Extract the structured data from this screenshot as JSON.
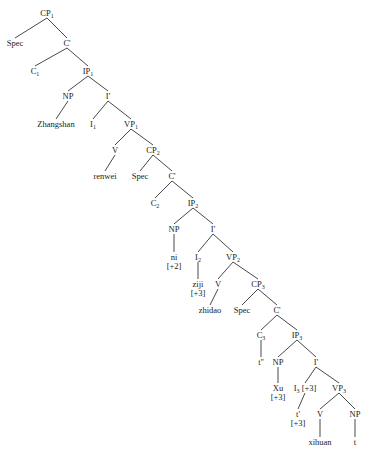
{
  "diagram": {
    "type": "syntax-tree",
    "nodes": [
      {
        "id": "cp1",
        "label": "CP",
        "sub": "1",
        "x": 47,
        "y": 14
      },
      {
        "id": "spec1",
        "label": "Spec",
        "x": 15,
        "y": 44
      },
      {
        "id": "cbar1",
        "label": "C'",
        "x": 67,
        "y": 44
      },
      {
        "id": "c1",
        "label": "C",
        "sub": "1",
        "x": 35,
        "y": 72
      },
      {
        "id": "ip1",
        "label": "IP",
        "sub": "1",
        "x": 88,
        "y": 72
      },
      {
        "id": "np1",
        "label": "NP",
        "x": 68,
        "y": 97
      },
      {
        "id": "ibar1",
        "label": "I'",
        "x": 108,
        "y": 97
      },
      {
        "id": "zhangshan",
        "label": "Zhangshan",
        "x": 56,
        "y": 125
      },
      {
        "id": "i1",
        "label": "I",
        "sub": "1",
        "x": 93,
        "y": 125
      },
      {
        "id": "vp1",
        "label": "VP",
        "sub": "1",
        "x": 131,
        "y": 125
      },
      {
        "id": "v1",
        "label": "V",
        "x": 115,
        "y": 151
      },
      {
        "id": "cp2",
        "label": "CP",
        "sub": "2",
        "x": 153,
        "y": 151
      },
      {
        "id": "renwei",
        "label": "renwei",
        "x": 105,
        "y": 177
      },
      {
        "id": "spec2",
        "label": "Spec",
        "x": 140,
        "y": 177
      },
      {
        "id": "cbar2",
        "label": "C'",
        "x": 172,
        "y": 177
      },
      {
        "id": "c2",
        "label": "C",
        "sub": "2",
        "x": 155,
        "y": 204
      },
      {
        "id": "ip2",
        "label": "IP",
        "sub": "2",
        "x": 193,
        "y": 204
      },
      {
        "id": "np2",
        "label": "NP",
        "x": 174,
        "y": 230
      },
      {
        "id": "ibar2",
        "label": "I'",
        "x": 213,
        "y": 230
      },
      {
        "id": "ni",
        "label": "ni",
        "extra": "[+2]",
        "x": 174,
        "y": 258
      },
      {
        "id": "i2",
        "label": "I",
        "sub": "2",
        "x": 198,
        "y": 258
      },
      {
        "id": "vp2",
        "label": "VP",
        "sub": "2",
        "x": 233,
        "y": 258
      },
      {
        "id": "ziji",
        "label": "ziji",
        "extra": "[+3]",
        "x": 198,
        "y": 285
      },
      {
        "id": "v2",
        "label": "V",
        "x": 218,
        "y": 285
      },
      {
        "id": "cp3",
        "label": "CP",
        "sub": "3",
        "x": 258,
        "y": 285
      },
      {
        "id": "zhidao",
        "label": "zhidao",
        "x": 210,
        "y": 311
      },
      {
        "id": "spec3",
        "label": "Spec",
        "x": 242,
        "y": 311
      },
      {
        "id": "cbar3",
        "label": "C'",
        "x": 277,
        "y": 311
      },
      {
        "id": "c3",
        "label": "C",
        "sub": "3",
        "x": 261,
        "y": 336
      },
      {
        "id": "ip3",
        "label": "IP",
        "sub": "3",
        "x": 297,
        "y": 336
      },
      {
        "id": "tpp",
        "label": "t''",
        "x": 261,
        "y": 363
      },
      {
        "id": "np3",
        "label": "NP",
        "x": 278,
        "y": 363
      },
      {
        "id": "ibar3",
        "label": "I'",
        "x": 316,
        "y": 363
      },
      {
        "id": "xu",
        "label": "Xu",
        "extra": "[+3]",
        "x": 278,
        "y": 389
      },
      {
        "id": "i3",
        "label": "I",
        "sub": "3",
        "after": " [+3]",
        "x": 305,
        "y": 389
      },
      {
        "id": "vp3",
        "label": "VP",
        "sub": "3",
        "x": 339,
        "y": 389
      },
      {
        "id": "tp",
        "label": "t'",
        "extra": "[+3]",
        "x": 298,
        "y": 415
      },
      {
        "id": "v3",
        "label": "V",
        "x": 320,
        "y": 415
      },
      {
        "id": "np4",
        "label": "NP",
        "x": 355,
        "y": 415
      },
      {
        "id": "xihuan",
        "label": "xihuan",
        "x": 320,
        "y": 443
      },
      {
        "id": "t",
        "label": "t",
        "x": 355,
        "y": 443
      }
    ],
    "edges": [
      [
        "cp1",
        "spec1"
      ],
      [
        "cp1",
        "cbar1"
      ],
      [
        "cbar1",
        "c1"
      ],
      [
        "cbar1",
        "ip1"
      ],
      [
        "ip1",
        "np1"
      ],
      [
        "ip1",
        "ibar1"
      ],
      [
        "np1",
        "zhangshan"
      ],
      [
        "ibar1",
        "i1"
      ],
      [
        "ibar1",
        "vp1"
      ],
      [
        "vp1",
        "v1"
      ],
      [
        "vp1",
        "cp2"
      ],
      [
        "v1",
        "renwei"
      ],
      [
        "cp2",
        "spec2"
      ],
      [
        "cp2",
        "cbar2"
      ],
      [
        "cbar2",
        "c2"
      ],
      [
        "cbar2",
        "ip2"
      ],
      [
        "ip2",
        "np2"
      ],
      [
        "ip2",
        "ibar2"
      ],
      [
        "np2",
        "ni"
      ],
      [
        "ibar2",
        "i2"
      ],
      [
        "ibar2",
        "vp2"
      ],
      [
        "i2",
        "ziji"
      ],
      [
        "vp2",
        "v2"
      ],
      [
        "vp2",
        "cp3"
      ],
      [
        "v2",
        "zhidao"
      ],
      [
        "cp3",
        "spec3"
      ],
      [
        "cp3",
        "cbar3"
      ],
      [
        "cbar3",
        "c3"
      ],
      [
        "cbar3",
        "ip3"
      ],
      [
        "c3",
        "tpp"
      ],
      [
        "ip3",
        "np3"
      ],
      [
        "ip3",
        "ibar3"
      ],
      [
        "np3",
        "xu"
      ],
      [
        "ibar3",
        "i3"
      ],
      [
        "ibar3",
        "vp3"
      ],
      [
        "i3",
        "tp"
      ],
      [
        "vp3",
        "v3"
      ],
      [
        "vp3",
        "np4"
      ],
      [
        "v3",
        "xihuan"
      ],
      [
        "np4",
        "t"
      ]
    ]
  }
}
